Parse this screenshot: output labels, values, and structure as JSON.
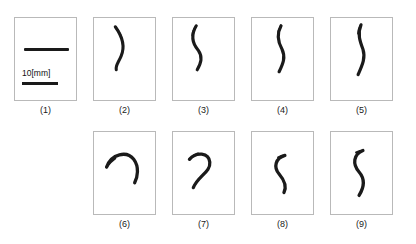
{
  "figure": {
    "type": "specimen-panel-grid",
    "background_color": "#ffffff",
    "panel_border_color": "#b9b9b9",
    "stroke_color": "#1a1a1a",
    "rows": 2,
    "top_row_count": 5,
    "bottom_row_count": 4,
    "total_panels": 9
  },
  "scale": {
    "label": "10[mm]",
    "bar_present": true
  },
  "panels": [
    {
      "id": "panel-1",
      "caption": "(1)",
      "content": "straight-reference-specimen-with-scale-bar",
      "shape": "straight-horizontal-line",
      "has_scale_bar": true
    },
    {
      "id": "panel-2",
      "caption": "(2)",
      "content": "deformed-specimen",
      "shape": "short-curved-stroke",
      "has_scale_bar": false
    },
    {
      "id": "panel-3",
      "caption": "(3)",
      "content": "deformed-specimen",
      "shape": "slender-s-curve",
      "has_scale_bar": false
    },
    {
      "id": "panel-4",
      "caption": "(4)",
      "content": "deformed-specimen",
      "shape": "near-vertical-wavy-stroke",
      "has_scale_bar": false
    },
    {
      "id": "panel-5",
      "caption": "(5)",
      "content": "deformed-specimen",
      "shape": "elongated-vertical-wavy-stroke",
      "has_scale_bar": false
    },
    {
      "id": "panel-6",
      "caption": "(6)",
      "content": "deformed-specimen",
      "shape": "inverted-u-arch",
      "has_scale_bar": false
    },
    {
      "id": "panel-7",
      "caption": "(7)",
      "content": "deformed-specimen",
      "shape": "question-mark-hook",
      "has_scale_bar": false
    },
    {
      "id": "panel-8",
      "caption": "(8)",
      "content": "deformed-specimen",
      "shape": "compact-s-curve",
      "has_scale_bar": false
    },
    {
      "id": "panel-9",
      "caption": "(9)",
      "content": "deformed-specimen",
      "shape": "elongated-s-curve",
      "has_scale_bar": false
    }
  ]
}
